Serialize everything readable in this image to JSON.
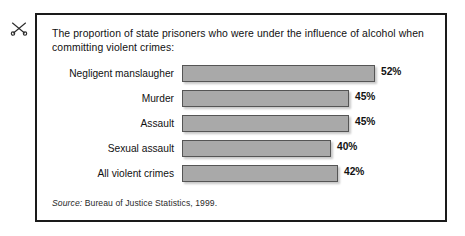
{
  "figure": {
    "caption": "The proportion of state prisoners who were under the influence of alcohol when committing violent crimes:",
    "source_label": "Source:",
    "source_text": "Bureau of Justice Statistics, 1999.",
    "scissors_icon_name": "scissors-icon",
    "colors": {
      "bar_fill": "#a9a9a9",
      "bar_stroke": "#555555",
      "frame_border": "#1a1a1a",
      "text": "#111111",
      "background": "#ffffff"
    }
  },
  "chart_data": {
    "type": "bar",
    "orientation": "horizontal",
    "title": "The proportion of state prisoners who were under the influence of alcohol when committing violent crimes:",
    "xlabel": "",
    "ylabel": "",
    "xlim": [
      0,
      60
    ],
    "grid": false,
    "legend": "none",
    "value_suffix": "%",
    "categories": [
      "Negligent manslaugher",
      "Murder",
      "Assault",
      "Sexual assault",
      "All violent crimes"
    ],
    "values": [
      52,
      45,
      45,
      40,
      42
    ],
    "value_labels": [
      "52%",
      "45%",
      "45%",
      "40%",
      "42%"
    ],
    "annotations": [
      "Source: Bureau of Justice Statistics, 1999."
    ]
  }
}
